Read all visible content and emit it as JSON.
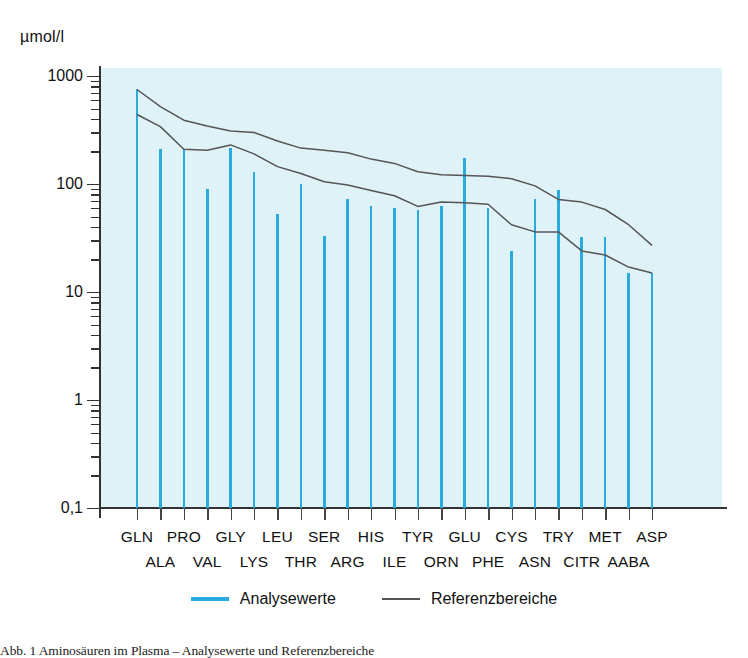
{
  "figure": {
    "unit_label": "µmol/l",
    "caption": "Abb. 1  Aminosäuren im Plasma – Analysewerte und Referenzbereiche"
  },
  "legend": {
    "position": "bottom-center",
    "items": [
      {
        "label": "Analysewerte",
        "color": "#29abe2",
        "swatch": "analyse"
      },
      {
        "label": "Referenzbereiche",
        "color": "#555555",
        "swatch": "referenz"
      }
    ]
  },
  "colors": {
    "panel_background": "#dff2f8",
    "bar": "#29abe2",
    "reference_line": "#555555",
    "axis": "#333333",
    "text": "#111111"
  },
  "chart_data": {
    "type": "bar",
    "title": "",
    "subtitle": "",
    "xlabel": "",
    "ylabel": "µmol/l",
    "yscale": "log",
    "ylim": [
      0.1,
      1000
    ],
    "ytick_labels": [
      "1000",
      "100",
      "10",
      "1",
      "0,1"
    ],
    "ytick_values": [
      1000,
      100,
      10,
      1,
      0.1
    ],
    "grid": false,
    "categories": [
      "GLN",
      "ALA",
      "PRO",
      "VAL",
      "GLY",
      "LYS",
      "LEU",
      "THR",
      "SER",
      "ARG",
      "HIS",
      "ILE",
      "TYR",
      "ORN",
      "GLU",
      "PHE",
      "CYS",
      "ASN",
      "TRY",
      "CITR",
      "MET",
      "AABA",
      "ASP"
    ],
    "category_label_rows": {
      "top": [
        "GLN",
        "PRO",
        "GLY",
        "LEU",
        "SER",
        "HIS",
        "TYR",
        "GLU",
        "CYS",
        "TRY",
        "MET",
        "ASP"
      ],
      "bottom": [
        "ALA",
        "VAL",
        "LYS",
        "THR",
        "ARG",
        "ILE",
        "ORN",
        "PHE",
        "ASN",
        "CITR",
        "AABA"
      ]
    },
    "series": [
      {
        "name": "Analysewerte",
        "type": "bar",
        "color": "#29abe2",
        "values": [
          750,
          210,
          210,
          90,
          215,
          130,
          53,
          100,
          33,
          73,
          62,
          60,
          57,
          62,
          175,
          60,
          24,
          73,
          88,
          32,
          32,
          15,
          15
        ]
      },
      {
        "name": "Referenzbereiche (obere Grenze)",
        "type": "line",
        "color": "#555555",
        "values": [
          750,
          520,
          390,
          345,
          310,
          300,
          250,
          215,
          205,
          195,
          170,
          155,
          130,
          122,
          120,
          118,
          112,
          96,
          72,
          68,
          58,
          42,
          27
        ]
      },
      {
        "name": "Referenzbereiche (untere Grenze)",
        "type": "line",
        "color": "#555555",
        "values": [
          440,
          340,
          210,
          205,
          230,
          190,
          145,
          125,
          105,
          98,
          87,
          78,
          62,
          68,
          67,
          65,
          42,
          36,
          36,
          24,
          22,
          17,
          15
        ]
      }
    ]
  }
}
